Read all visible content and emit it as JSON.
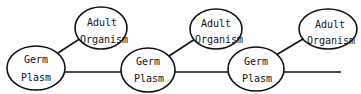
{
  "diagram": {
    "type": "lineage",
    "line_color": "#111111",
    "background": "#ffffff",
    "nodes": [
      {
        "id": "germ1",
        "line1": "Germ",
        "line2": "Plasm",
        "cx": 36,
        "cy": 68,
        "rx": 29,
        "ry": 22
      },
      {
        "id": "adult1",
        "line1": "Adult",
        "line2": "Organism",
        "cx": 101,
        "cy": 28,
        "rx": 26,
        "ry": 21
      },
      {
        "id": "germ2",
        "line1": "Germ",
        "line2": "Plasm",
        "cx": 148,
        "cy": 70,
        "rx": 27,
        "ry": 22
      },
      {
        "id": "adult2",
        "line1": "Adult",
        "line2": "Organism",
        "cx": 216,
        "cy": 29,
        "rx": 26,
        "ry": 20
      },
      {
        "id": "germ3",
        "line1": "Germ",
        "line2": "Plasm",
        "cx": 256,
        "cy": 69,
        "rx": 28,
        "ry": 22
      },
      {
        "id": "adult3",
        "line1": "Adult",
        "line2": "Organism",
        "cx": 328,
        "cy": 29,
        "rx": 29,
        "ry": 20
      }
    ],
    "edges": [
      {
        "from": "germ1",
        "to": "adult1",
        "kind": "diagonal"
      },
      {
        "from": "germ1",
        "to": "germ2",
        "kind": "horizontal"
      },
      {
        "from": "germ2",
        "to": "adult2",
        "kind": "diagonal"
      },
      {
        "from": "germ2",
        "to": "germ3",
        "kind": "horizontal"
      },
      {
        "from": "germ3",
        "to": "adult3",
        "kind": "diagonal"
      },
      {
        "from": "germ3",
        "to": "continuation",
        "kind": "horizontal"
      }
    ]
  }
}
